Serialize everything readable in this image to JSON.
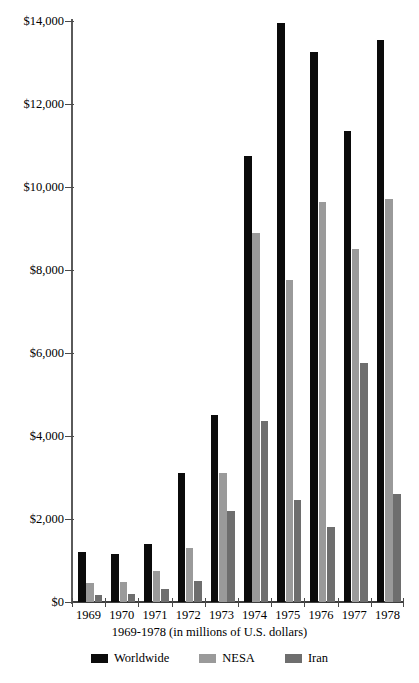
{
  "chart_data": {
    "type": "bar",
    "title": "U.S. Arms Sales Agreements, 1969-1978",
    "subtitle": "",
    "xlabel": "1969-1978 (in millions of U.S. dollars)",
    "ylabel": "",
    "categories": [
      "1969",
      "1970",
      "1971",
      "1972",
      "1973",
      "1974",
      "1975",
      "1976",
      "1977",
      "1978"
    ],
    "series": [
      {
        "name": "Worldwide",
        "color": "#0b0b0b",
        "values": [
          1200,
          1150,
          1400,
          3100,
          4500,
          10750,
          13950,
          13250,
          11350,
          13550
        ]
      },
      {
        "name": "NESA",
        "color": "#9a9a9a",
        "values": [
          450,
          480,
          750,
          1300,
          3100,
          8900,
          7750,
          9650,
          8500,
          9700
        ]
      },
      {
        "name": "Iran",
        "color": "#6e6e6e",
        "values": [
          180,
          200,
          320,
          500,
          2200,
          4350,
          2450,
          1800,
          5750,
          2600
        ]
      }
    ],
    "ylim": [
      0,
      14000
    ],
    "ytick_values": [
      0,
      2000,
      4000,
      6000,
      8000,
      10000,
      12000,
      14000
    ],
    "ytick_labels": [
      "$0",
      "$2,000",
      "$4,000",
      "$6,000",
      "$8,000",
      "$10,000",
      "$12,000",
      "$14,000"
    ],
    "grid": false,
    "legend_position": "bottom",
    "legend": [
      "Worldwide",
      "NESA",
      "Iran"
    ]
  }
}
